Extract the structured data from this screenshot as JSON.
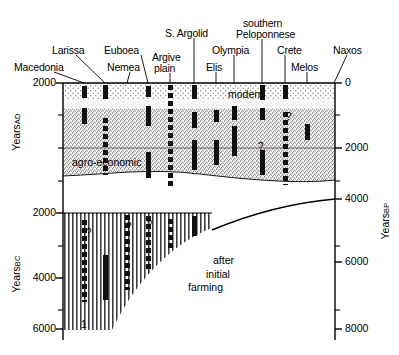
{
  "figure": {
    "site_labels": [
      {
        "text": "Macedonia",
        "x": 14,
        "y": 62,
        "anchor": "start",
        "tick_x": 84
      },
      {
        "text": "Larissa",
        "x": 52,
        "y": 45,
        "anchor": "start",
        "tick_x": 105
      },
      {
        "text": "Nemea",
        "x": 107,
        "y": 62,
        "anchor": "start",
        "tick_x": 127
      },
      {
        "text": "Euboea",
        "x": 104,
        "y": 45,
        "anchor": "start",
        "tick_x": 148
      },
      {
        "text": "Argive",
        "x": 152,
        "y": 52,
        "anchor": "start",
        "tick_x": 170
      },
      {
        "text": "plain",
        "x": 154,
        "y": 63,
        "anchor": "start",
        "tick_x": 170
      },
      {
        "text": "S. Argolid",
        "x": 165,
        "y": 28,
        "anchor": "start",
        "tick_x": 194
      },
      {
        "text": "Elis",
        "x": 206,
        "y": 62,
        "anchor": "start",
        "tick_x": 216
      },
      {
        "text": "Olympia",
        "x": 212,
        "y": 45,
        "anchor": "start",
        "tick_x": 234
      },
      {
        "text": "southern",
        "x": 243,
        "y": 18,
        "anchor": "start",
        "tick_x": 262
      },
      {
        "text": "Peloponnese",
        "x": 236,
        "y": 29,
        "anchor": "start",
        "tick_x": 262
      },
      {
        "text": "Crete",
        "x": 277,
        "y": 45,
        "anchor": "start",
        "tick_x": 285
      },
      {
        "text": "Melos",
        "x": 291,
        "y": 62,
        "anchor": "start",
        "tick_x": 307
      },
      {
        "text": "Naxos",
        "x": 333,
        "y": 45,
        "anchor": "start",
        "tick_x": 335
      }
    ],
    "zone_labels": [
      {
        "text": "modern",
        "x": 228,
        "y": 88
      },
      {
        "text": "agro-economic",
        "x": 72,
        "y": 156
      },
      {
        "text": "after",
        "x": 213,
        "y": 254
      },
      {
        "text": "initial",
        "x": 206,
        "y": 268
      },
      {
        "text": "farming",
        "x": 188,
        "y": 281
      },
      {
        "text": "1",
        "x": 81,
        "y": 318
      }
    ],
    "left_axis": {
      "title_ad": "Years",
      "title_ad_sub": "AD",
      "title_bc": "Years",
      "title_bc_sub": "BC",
      "ticks": [
        {
          "label": "2000",
          "y": 83,
          "major": true
        },
        {
          "label": "",
          "y": 115,
          "major": false
        },
        {
          "label": "",
          "y": 148,
          "major": false
        },
        {
          "label": "",
          "y": 181,
          "major": false
        },
        {
          "label": "2000",
          "y": 213,
          "major": true
        },
        {
          "label": "",
          "y": 246,
          "major": false
        },
        {
          "label": "4000",
          "y": 278,
          "major": true
        },
        {
          "label": "",
          "y": 310,
          "major": false
        },
        {
          "label": "6000",
          "y": 329,
          "major": true
        }
      ]
    },
    "right_axis": {
      "title": "Years",
      "title_sub": "BP",
      "ticks": [
        {
          "label": "0",
          "y": 83,
          "major": true
        },
        {
          "label": "",
          "y": 115,
          "major": false
        },
        {
          "label": "2000",
          "y": 148,
          "major": true
        },
        {
          "label": "",
          "y": 181,
          "major": false
        },
        {
          "label": "4000",
          "y": 199,
          "major": true
        },
        {
          "label": "",
          "y": 246,
          "major": false
        },
        {
          "label": "6000",
          "y": 262,
          "major": true
        },
        {
          "label": "",
          "y": 310,
          "major": false
        },
        {
          "label": "8000",
          "y": 329,
          "major": true
        }
      ]
    }
  },
  "chart_data": {
    "type": "scatter",
    "title": "",
    "subtitle": "",
    "xlabel": "",
    "ylabel": "Years AD / Years BC",
    "ylabel_right": "Years BP",
    "ylim_left": [
      2000,
      -6000
    ],
    "ylim_right": [
      0,
      8000
    ],
    "left_ticks": [
      2000,
      0,
      -2000,
      -4000,
      -6000
    ],
    "right_ticks": [
      0,
      2000,
      4000,
      6000,
      8000
    ],
    "grid": false,
    "legend": "none",
    "zones": [
      {
        "name": "modern",
        "shading": "light-stipple",
        "y_from_px": 83,
        "y_to_px": 105
      },
      {
        "name": "agro-economic",
        "shading": "dense-stipple",
        "y_from_px": 105,
        "y_to_px": 175
      },
      {
        "name": "after initial farming",
        "shading": "vertical-hatch",
        "y_from_px": 213,
        "y_to_px": 330
      }
    ],
    "categories": [
      "Macedonia",
      "Larissa",
      "Nemea",
      "Euboea",
      "Argive plain",
      "S. Argolid",
      "Elis",
      "Olympia",
      "southern Peloponnese",
      "Crete",
      "Melos",
      "Naxos"
    ],
    "series": [
      {
        "name": "pollen / record occurrences",
        "note": "vertical bars mark intervals of record at each site; dashed bars are discontinuous records; '?' marks uncertain extents",
        "columns": [
          {
            "site": "Macedonia",
            "x_px": 84,
            "bars": [
              {
                "y0": 86,
                "y1": 98,
                "style": "solid"
              },
              {
                "y0": 108,
                "y1": 124,
                "style": "solid"
              },
              {
                "y0": 220,
                "y1": 302,
                "style": "dashed"
              }
            ],
            "qmark": {
              "x": 86,
              "y": 228
            }
          },
          {
            "site": "Larissa",
            "x_px": 105,
            "bars": [
              {
                "y0": 85,
                "y1": 99,
                "style": "solid"
              },
              {
                "y0": 118,
                "y1": 175,
                "style": "dashed-solid"
              },
              {
                "y0": 255,
                "y1": 300,
                "style": "solid"
              }
            ],
            "qmark": null
          },
          {
            "site": "Nemea",
            "x_px": 127,
            "bars": [
              {
                "y0": 215,
                "y1": 290,
                "style": "dashed"
              }
            ],
            "qmark": {
              "x": 126,
              "y": 222
            }
          },
          {
            "site": "Euboea",
            "x_px": 148,
            "bars": [
              {
                "y0": 86,
                "y1": 97,
                "style": "solid"
              },
              {
                "y0": 106,
                "y1": 126,
                "style": "solid"
              },
              {
                "y0": 152,
                "y1": 178,
                "style": "solid"
              },
              {
                "y0": 216,
                "y1": 272,
                "style": "dashed"
              }
            ],
            "qmark": {
              "x": 147,
              "y": 220
            }
          },
          {
            "site": "Argive plain",
            "x_px": 170,
            "bars": [
              {
                "y0": 85,
                "y1": 187,
                "style": "dashed"
              },
              {
                "y0": 219,
                "y1": 250,
                "style": "dashed"
              }
            ],
            "qmark": null
          },
          {
            "site": "S. Argolid",
            "x_px": 194,
            "bars": [
              {
                "y0": 85,
                "y1": 99,
                "style": "solid"
              },
              {
                "y0": 112,
                "y1": 128,
                "style": "solid"
              },
              {
                "y0": 140,
                "y1": 170,
                "style": "solid"
              },
              {
                "y0": 216,
                "y1": 236,
                "style": "solid"
              }
            ],
            "qmark": null
          },
          {
            "site": "Elis",
            "x_px": 216,
            "bars": [
              {
                "y0": 110,
                "y1": 122,
                "style": "solid"
              },
              {
                "y0": 140,
                "y1": 165,
                "style": "solid"
              }
            ],
            "qmark": null
          },
          {
            "site": "Olympia",
            "x_px": 234,
            "bars": [
              {
                "y0": 106,
                "y1": 120,
                "style": "solid"
              },
              {
                "y0": 126,
                "y1": 156,
                "style": "solid"
              }
            ],
            "qmark": null
          },
          {
            "site": "southern Peloponnese",
            "x_px": 262,
            "bars": [
              {
                "y0": 85,
                "y1": 100,
                "style": "solid"
              },
              {
                "y0": 108,
                "y1": 120,
                "style": "solid"
              },
              {
                "y0": 150,
                "y1": 175,
                "style": "solid"
              }
            ],
            "qmark": {
              "x": 258,
              "y": 142
            }
          },
          {
            "site": "Crete",
            "x_px": 285,
            "bars": [
              {
                "y0": 85,
                "y1": 99,
                "style": "solid"
              },
              {
                "y0": 112,
                "y1": 185,
                "style": "dashed"
              }
            ],
            "qmark": {
              "x": 286,
              "y": 112
            }
          },
          {
            "site": "Melos",
            "x_px": 307,
            "bars": [
              {
                "y0": 124,
                "y1": 140,
                "style": "solid"
              }
            ],
            "qmark": null
          },
          {
            "site": "Naxos",
            "x_px": 328,
            "bars": [],
            "qmark": null
          }
        ]
      }
    ],
    "annotations": [
      {
        "text": "modern",
        "kind": "zone-label"
      },
      {
        "text": "agro-economic",
        "kind": "zone-label"
      },
      {
        "text": "after initial farming",
        "kind": "zone-label"
      },
      {
        "text": "1",
        "kind": "zone-number"
      }
    ]
  }
}
